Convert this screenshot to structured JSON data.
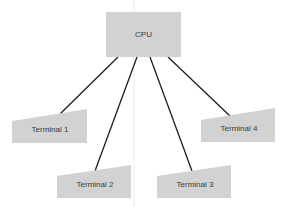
{
  "diagram": {
    "cpu": {
      "label": "CPU"
    },
    "terminals": [
      {
        "label": "Terminal 1"
      },
      {
        "label": "Terminal 2"
      },
      {
        "label": "Terminal 3"
      },
      {
        "label": "Terminal 4"
      }
    ],
    "colors": {
      "box": "#d2d2d2",
      "line": "#1e1e1e",
      "divider": "#ececec"
    }
  }
}
